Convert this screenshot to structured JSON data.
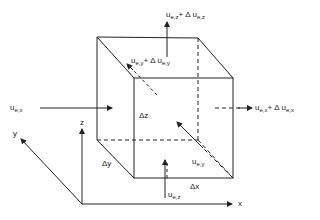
{
  "diagram": {
    "axes": {
      "x_label": "x",
      "y_label": "y",
      "z_label": "z"
    },
    "dimensions": {
      "dx": "Δx",
      "dy": "Δy",
      "dz": "Δz"
    },
    "fluxes": {
      "in_x": {
        "base": "u",
        "sub": "e,x"
      },
      "out_x": {
        "base": "u",
        "sub": "e,x",
        "plus": "+ Δ u",
        "sub2": "e,x"
      },
      "in_y": {
        "base": "u",
        "sub": "e,y"
      },
      "out_y": {
        "base": "u",
        "sub": "e,y",
        "plus": "+ Δ u",
        "sub2": "e,y"
      },
      "in_z": {
        "base": "u",
        "sub": "e,z"
      },
      "out_z": {
        "base": "u",
        "sub": "e,z",
        "plus": "+ Δ u",
        "sub2": "e,z"
      }
    },
    "colors": {
      "line": "#222222",
      "background": "#ffffff"
    }
  }
}
